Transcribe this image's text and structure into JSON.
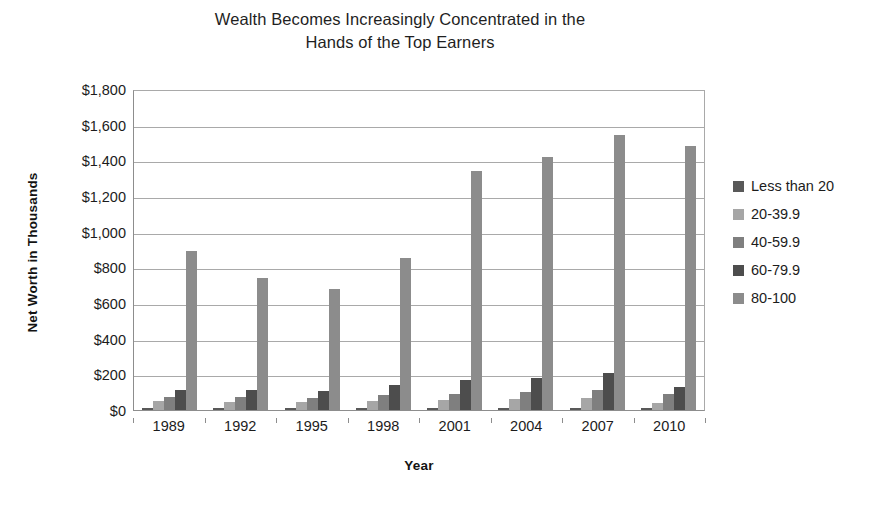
{
  "chart_data": {
    "type": "bar",
    "title": "Wealth Becomes Increasingly Concentrated in the\nHands of the Top Earners",
    "xlabel": "Year",
    "ylabel": "Net Worth in Thousands",
    "categories": [
      "1989",
      "1992",
      "1995",
      "1998",
      "2001",
      "2004",
      "2007",
      "2010"
    ],
    "ytick_labels": [
      "$1,800",
      "$1,600",
      "$1,400",
      "$1,200",
      "$1,000",
      "$800",
      "$600",
      "$400",
      "$200",
      "$0"
    ],
    "ytick_values": [
      1800,
      1600,
      1400,
      1200,
      1000,
      800,
      600,
      400,
      200,
      0
    ],
    "ylim": [
      0,
      1800
    ],
    "ytick_step": 200,
    "grid": true,
    "legend_position": "right",
    "series": [
      {
        "name": "Less than 20",
        "color": "#595959",
        "values": [
          12,
          10,
          10,
          12,
          12,
          13,
          14,
          10
        ]
      },
      {
        "name": "20-39.9",
        "color": "#a6a6a6",
        "values": [
          48,
          47,
          45,
          52,
          58,
          62,
          70,
          40
        ]
      },
      {
        "name": "40-59.9",
        "color": "#7f7f7f",
        "values": [
          72,
          74,
          70,
          82,
          92,
          100,
          115,
          88
        ]
      },
      {
        "name": "60-79.9",
        "color": "#4d4d4d",
        "values": [
          110,
          112,
          106,
          143,
          170,
          178,
          205,
          128
        ]
      },
      {
        "name": "80-100",
        "color": "#8c8c8c",
        "values": [
          890,
          740,
          680,
          850,
          1340,
          1420,
          1540,
          1480
        ]
      }
    ]
  }
}
